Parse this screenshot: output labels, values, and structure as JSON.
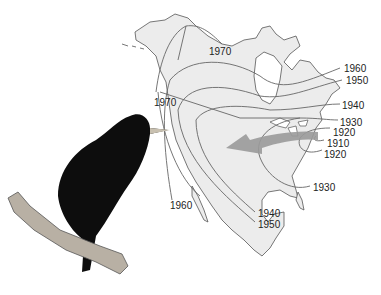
{
  "figure": {
    "bird_illustration": "starling-perched-on-branch",
    "arrow_direction": "westward"
  },
  "isochrone_labels": [
    {
      "year": "1970",
      "x": 210,
      "y": 47
    },
    {
      "year": "1970",
      "x": 155,
      "y": 98
    },
    {
      "year": "1960",
      "x": 344,
      "y": 64
    },
    {
      "year": "1950",
      "x": 346,
      "y": 76
    },
    {
      "year": "1940",
      "x": 342,
      "y": 101
    },
    {
      "year": "1930",
      "x": 340,
      "y": 118
    },
    {
      "year": "1920",
      "x": 333,
      "y": 127
    },
    {
      "year": "1910",
      "x": 327,
      "y": 139
    },
    {
      "year": "1920",
      "x": 325,
      "y": 150
    },
    {
      "year": "1930",
      "x": 313,
      "y": 183
    },
    {
      "year": "1960",
      "x": 170,
      "y": 201
    },
    {
      "year": "1940",
      "x": 258,
      "y": 209
    },
    {
      "year": "1950",
      "x": 258,
      "y": 220
    }
  ],
  "colors": {
    "land": "#ececec",
    "outline": "#555555",
    "isochrone": "#666666",
    "arrow": "#9a9a9a",
    "bird": "#0d0d0d",
    "branch": "#b8b0a4",
    "beak": "#c8c0b0"
  }
}
